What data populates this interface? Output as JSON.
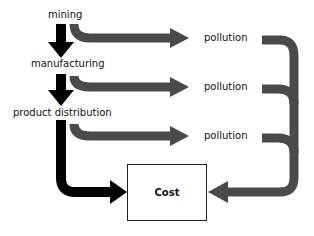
{
  "diagram": {
    "stages": [
      {
        "label": "mining"
      },
      {
        "label": "manufacturing"
      },
      {
        "label": "product distribution"
      }
    ],
    "outputs": [
      {
        "label": "pollution"
      },
      {
        "label": "pollution"
      },
      {
        "label": "pollution"
      }
    ],
    "sink": {
      "label": "Cost"
    },
    "colors": {
      "stage_arrow": "#000000",
      "pollution_arrow": "#4a4a4a"
    }
  }
}
